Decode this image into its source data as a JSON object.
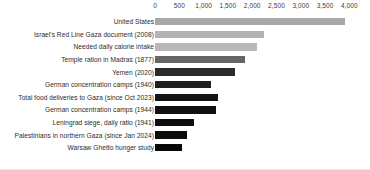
{
  "chart_data": {
    "type": "bar",
    "orientation": "horizontal",
    "title": "",
    "subtitle": "",
    "xlabel": "",
    "ylabel": "",
    "xlim": [
      0,
      4000
    ],
    "grid": false,
    "legend": null,
    "axis_ticks": [
      {
        "label": "0",
        "value": 0
      },
      {
        "label": "500",
        "value": 500
      },
      {
        "label": "1,000",
        "value": 1000
      },
      {
        "label": "1,500",
        "value": 1500
      },
      {
        "label": "2,000",
        "value": 2000
      },
      {
        "label": "2,500",
        "value": 2500
      },
      {
        "label": "3,000",
        "value": 3000
      },
      {
        "label": "3,500",
        "value": 3500
      },
      {
        "label": "4,000",
        "value": 4000
      }
    ],
    "categories": [
      "United States",
      "Israel's Red Line Gaza document (2008)",
      "Needed daily calorie intake",
      "Temple ration in Madras (1877)",
      "Yemen (2020)",
      "German concentration camps (1940)",
      "Total food deliveries to Gaza (since Oct 2023)",
      "German concentration camps (1944)",
      "Leningrad siege, daily ratio (1941)",
      "Palestinians in northern Gaza (since Jan 2024)",
      "Warsaw Ghetto hunger study"
    ],
    "values": [
      3900,
      2250,
      2100,
      1850,
      1650,
      1150,
      1300,
      1250,
      800,
      650,
      560
    ],
    "bar_colors": [
      "#a8a8a8",
      "#b3b3b3",
      "#b8b8b8",
      "#666666",
      "#2b2b2b",
      "#1f1f1f",
      "#141414",
      "#101010",
      "#0d0d0d",
      "#0a0a0a",
      "#080808"
    ]
  }
}
